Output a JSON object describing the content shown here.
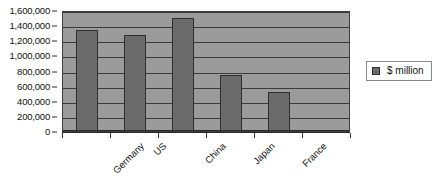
{
  "chart_data": {
    "type": "bar",
    "title": "",
    "xlabel": "",
    "ylabel": "",
    "categories": [
      "Germany",
      "US",
      "China",
      "Japan",
      "France",
      ""
    ],
    "values": [
      1340000,
      1270000,
      1500000,
      740000,
      515000,
      null
    ],
    "series": [
      {
        "name": "$ million",
        "values": [
          1340000,
          1270000,
          1500000,
          740000,
          515000,
          null
        ]
      }
    ],
    "ylim": [
      0,
      1600000
    ],
    "ytick_step": 200000,
    "ytick_labels": [
      "1,600,000",
      "1,400,000",
      "1,200,000",
      "1,000,000",
      "800,000",
      "600,000",
      "400,000",
      "200,000",
      "0"
    ],
    "ytick_values": [
      1600000,
      1400000,
      1200000,
      1000000,
      800000,
      600000,
      400000,
      200000,
      0
    ],
    "grid": true,
    "grid_axis": "y",
    "legend": {
      "position": "right",
      "entries": [
        {
          "label": "$ million",
          "swatch_name": "legend-swatch-dollar-million"
        }
      ]
    },
    "colors": {
      "plot_background": "#9b9b9b",
      "bar_fill": "#6b6b6b",
      "bar_border": "#2e2e2e",
      "gridline": "#3a3a3a",
      "axis": "#2a2a2a",
      "text": "#111111",
      "page_background": "#ffffff",
      "legend_border": "#8a8a8a"
    },
    "x_label_rotation_deg": -45
  }
}
